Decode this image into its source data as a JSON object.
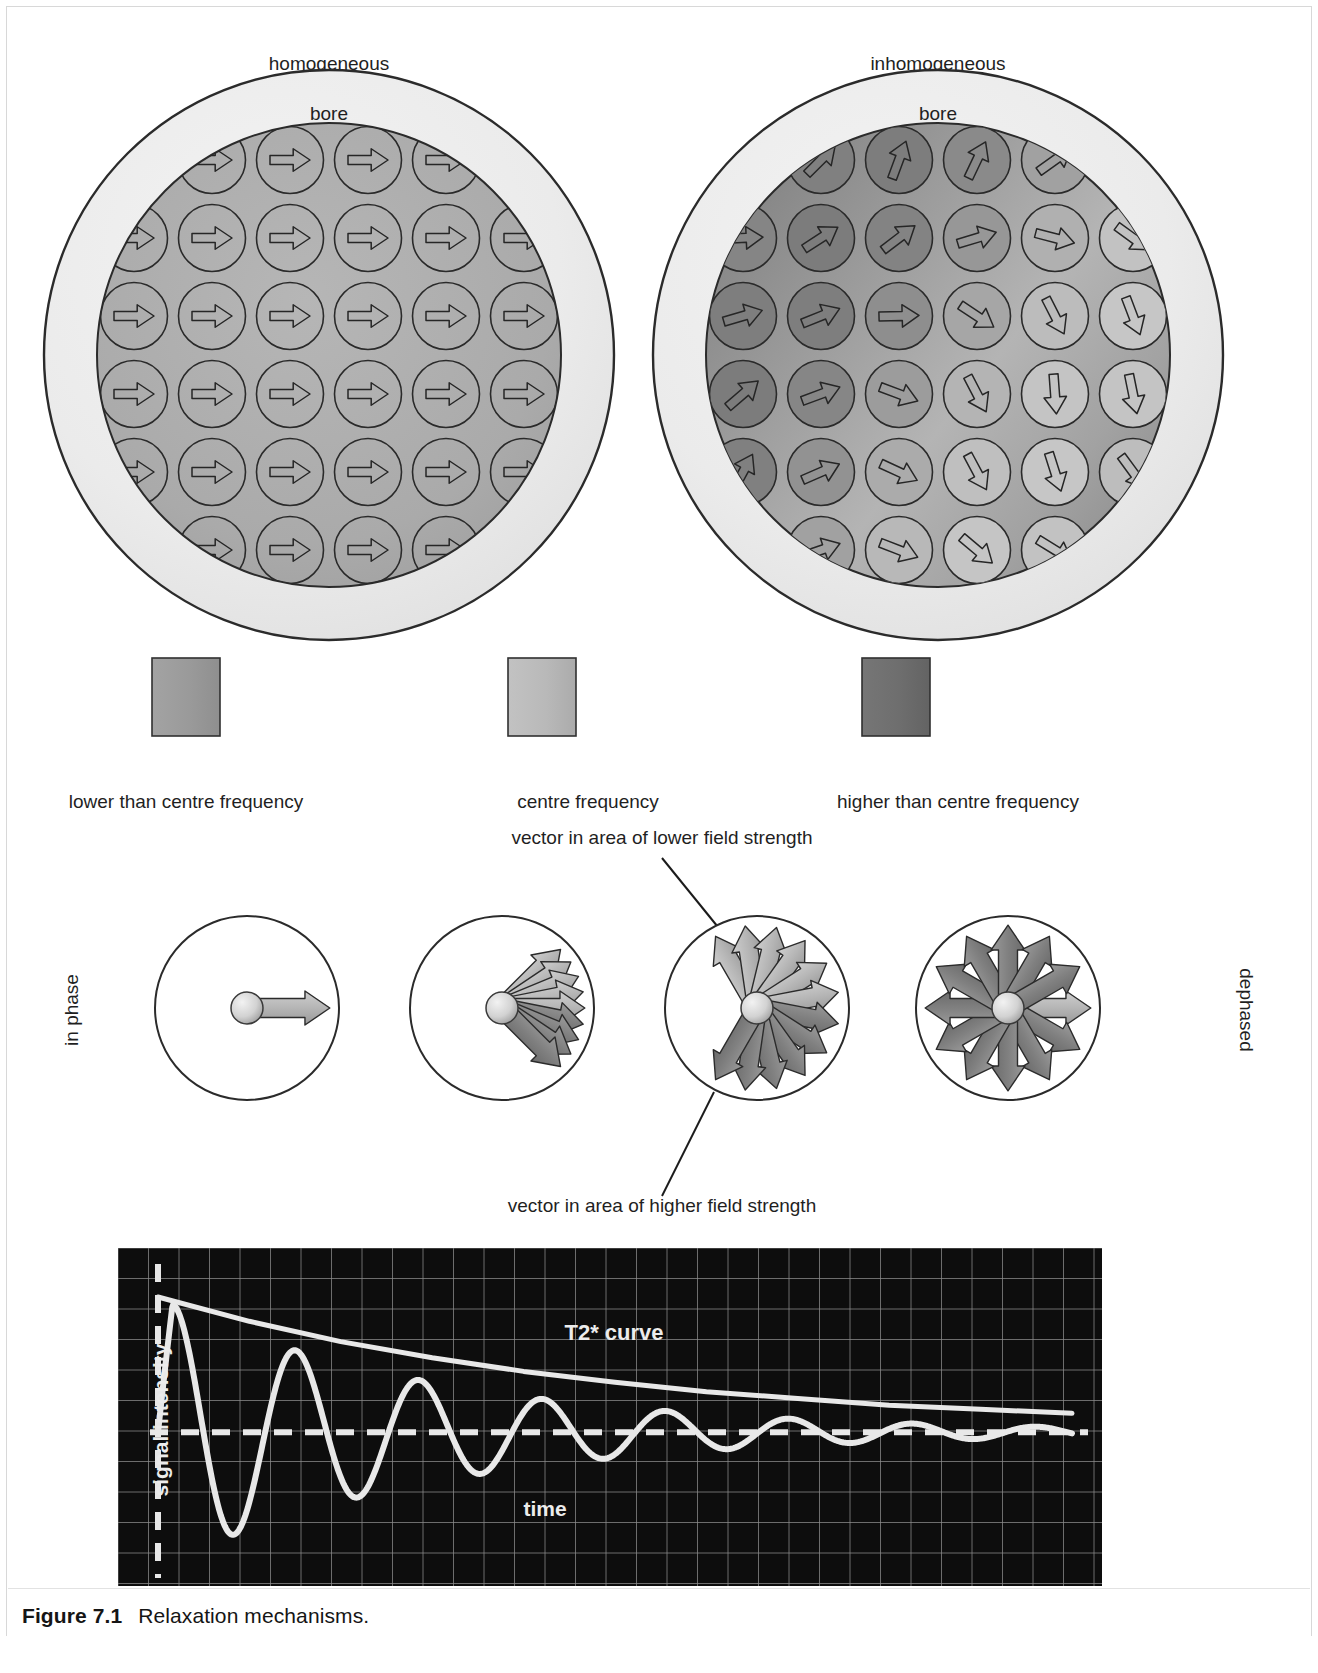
{
  "figure": {
    "number_label": "Figure 7.1",
    "caption": "Relaxation mechanisms."
  },
  "bore_panels": {
    "left": {
      "title": "homogeneous",
      "bore_label": "bore"
    },
    "right": {
      "title": "inhomogeneous",
      "bore_label": "bore"
    }
  },
  "legend": {
    "items": [
      {
        "label": "lower than centre frequency",
        "color": "#9a9a9a"
      },
      {
        "label": "centre frequency",
        "color": "#b9b9b9"
      },
      {
        "label": "higher than centre frequency",
        "color": "#6e6e6e"
      }
    ]
  },
  "vector_panel": {
    "left_label": "in phase",
    "right_label": "dephased",
    "callout_top": "vector in area of lower field strength",
    "callout_bottom": "vector in area of higher field strength",
    "stages": [
      {
        "name": "stage-1-in-phase",
        "vector_count": 1,
        "spread_degrees": 0
      },
      {
        "name": "stage-2-fanning",
        "vector_count": 9,
        "spread_degrees": 90
      },
      {
        "name": "stage-3-spreading",
        "vector_count": 12,
        "spread_degrees": 240
      },
      {
        "name": "stage-4-dephased",
        "vector_count": 12,
        "spread_degrees": 360
      }
    ]
  },
  "chart_data": {
    "type": "line",
    "title": "",
    "xlabel": "time",
    "ylabel": "signal intensity",
    "grid": true,
    "background": "#0d0d0d",
    "gridline_color": "#8d8d8d",
    "trace_color": "#e8e8e8",
    "annotations": [
      {
        "text": "T2* curve",
        "x": 0.52,
        "y": 0.74
      },
      {
        "text": "time",
        "x": 0.5,
        "y": 0.1
      },
      {
        "text": "signal intensity",
        "x": 0.035,
        "y": 0.5,
        "rotated": true
      }
    ],
    "series": [
      {
        "name": "FID (free induction decay)",
        "type": "oscillating-decay",
        "amplitude_start": 1.0,
        "decay_constant_T2star": 0.3,
        "period": 0.135,
        "x": [
          0.0,
          0.03,
          0.07,
          0.135,
          0.2,
          0.27,
          0.335,
          0.4,
          0.47,
          0.54,
          0.605,
          0.675,
          0.74,
          0.81,
          0.875,
          0.945,
          1.0
        ],
        "y": [
          0.0,
          0.96,
          0.0,
          -0.8,
          0.0,
          0.66,
          0.0,
          -0.55,
          0.0,
          0.45,
          0.0,
          -0.36,
          0.0,
          0.28,
          0.0,
          -0.18,
          0.05
        ]
      },
      {
        "name": "T2* envelope",
        "type": "exponential-decay",
        "x": [
          0.0,
          0.1,
          0.2,
          0.3,
          0.4,
          0.5,
          0.6,
          0.7,
          0.8,
          0.9,
          1.0
        ],
        "y": [
          1.0,
          0.82,
          0.67,
          0.55,
          0.45,
          0.37,
          0.3,
          0.25,
          0.2,
          0.17,
          0.14
        ]
      },
      {
        "name": "baseline",
        "type": "dashed-horizontal",
        "y": 0.0
      }
    ],
    "ylim": [
      -1.0,
      1.05
    ],
    "xlim": [
      0,
      1
    ]
  }
}
